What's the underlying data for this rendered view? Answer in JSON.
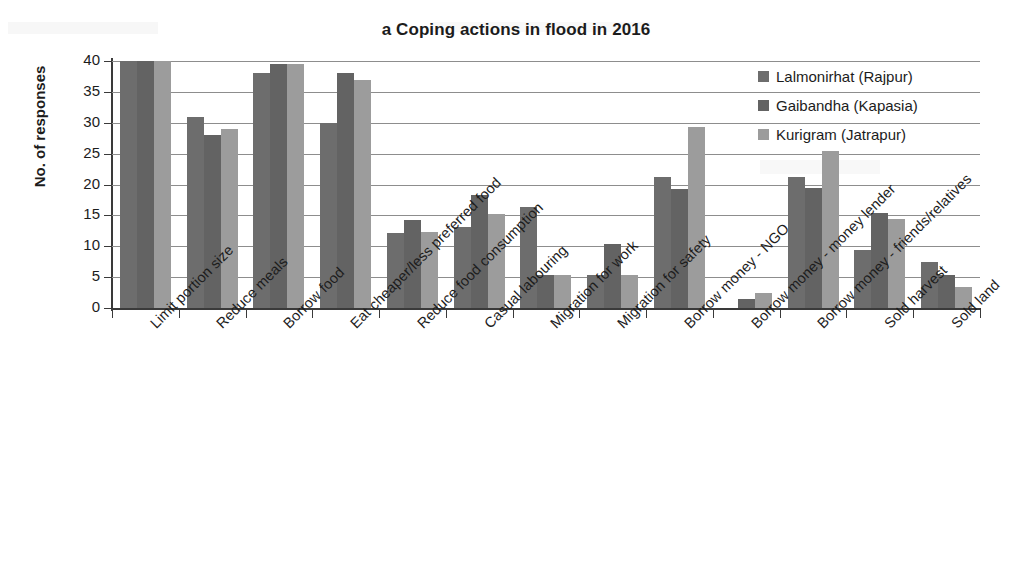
{
  "chart_data": {
    "type": "bar",
    "title": "a Coping actions in flood in 2016",
    "xlabel": "",
    "ylabel": "No. of responses",
    "ylim": [
      0,
      40
    ],
    "ytick_step": 5,
    "yticks": [
      0,
      5,
      10,
      15,
      20,
      25,
      30,
      35,
      40
    ],
    "grid": true,
    "legend_position": "top-right",
    "categories": [
      "Limit portion size",
      "Reduce meals",
      "Borrow food",
      "Eat cheaper/less preferred food",
      "Reduce food consumption",
      "Casual labouring",
      "Migration for work",
      "Migration for safety",
      "Borrow money - NGO",
      "Borrow money - money lender",
      "Borrow money - friends/relatives",
      "Sold harvest",
      "Sold land"
    ],
    "series": [
      {
        "name": "Lalmonirhat (Rajpur)",
        "color": "#6d6d6d",
        "values": [
          40,
          31,
          38,
          30,
          12.2,
          13.2,
          16.3,
          5.3,
          21.2,
          0,
          21.2,
          9.4,
          7.4
        ]
      },
      {
        "name": "Gaibandha (Kapasia)",
        "color": "#636363",
        "values": [
          40,
          28,
          39.5,
          38,
          14.2,
          18.3,
          5.3,
          10.3,
          19.3,
          1.4,
          19.4,
          15.4,
          5.4
        ]
      },
      {
        "name": "Kurigram (Jatrapur)",
        "color": "#9c9c9c",
        "values": [
          40,
          29,
          39.5,
          37,
          12.3,
          15.3,
          5.3,
          5.3,
          29.3,
          2.4,
          25.4,
          14.4,
          3.4
        ]
      }
    ]
  },
  "legend": {
    "items": [
      {
        "label": "Lalmonirhat (Rajpur)",
        "color": "#6d6d6d"
      },
      {
        "label": "Gaibandha (Kapasia)",
        "color": "#636363"
      },
      {
        "label": "Kurigram (Jatrapur)",
        "color": "#9c9c9c"
      }
    ]
  }
}
